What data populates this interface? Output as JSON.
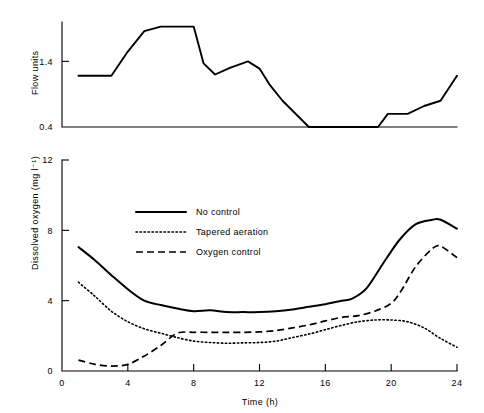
{
  "figure": {
    "background_color": "#ffffff",
    "ink_color": "#000000"
  },
  "chart_data": [
    {
      "id": "flow-chart",
      "type": "line",
      "title": "",
      "xlabel": "",
      "ylabel": "Flow units",
      "xlim": [
        0,
        24
      ],
      "ylim": [
        0.4,
        2.0
      ],
      "grid": false,
      "legend": "none",
      "yticks": [
        0.4,
        1.4
      ],
      "ytick_labels": [
        "0.4",
        "1.4"
      ],
      "xticks": [],
      "xtick_labels": [],
      "series": [
        {
          "name": "Flow",
          "style": "solid",
          "x": [
            1.0,
            3.0,
            4.0,
            5.0,
            6.0,
            7.0,
            8.0,
            8.6,
            9.3,
            10.2,
            11.3,
            12.0,
            12.6,
            13.4,
            15.0,
            19.2,
            19.8,
            21.0,
            22.0,
            23.0,
            24.0
          ],
          "y": [
            1.18,
            1.18,
            1.55,
            1.86,
            1.93,
            1.93,
            1.93,
            1.37,
            1.2,
            1.3,
            1.4,
            1.29,
            1.05,
            0.8,
            0.4,
            0.4,
            0.6,
            0.6,
            0.72,
            0.8,
            1.18
          ]
        }
      ]
    },
    {
      "id": "dissolved-oxygen-chart",
      "type": "line",
      "title": "",
      "xlabel": "Time (h)",
      "ylabel": "Dissolved oxygen (mg l⁻¹)",
      "xlim": [
        0,
        24
      ],
      "ylim": [
        0,
        12
      ],
      "grid": false,
      "legend": "inside-upper-left",
      "xticks": [
        0,
        4,
        8,
        12,
        16,
        20,
        24
      ],
      "xtick_labels": [
        "0",
        "4",
        "8",
        "12",
        "16",
        "20",
        "24"
      ],
      "yticks": [
        0,
        4,
        8,
        12
      ],
      "ytick_labels": [
        "0",
        "4",
        "8",
        "12"
      ],
      "series": [
        {
          "name": "No control",
          "style": "solid",
          "x": [
            1.0,
            2.0,
            3.0,
            4.0,
            5.0,
            6.0,
            7.0,
            8.0,
            9.0,
            10.0,
            11.0,
            12.0,
            13.0,
            14.0,
            15.0,
            16.0,
            17.0,
            17.6,
            18.5,
            19.5,
            20.5,
            21.5,
            22.5,
            23.0,
            24.0
          ],
          "y": [
            7.05,
            6.3,
            5.45,
            4.65,
            4.0,
            3.75,
            3.55,
            3.4,
            3.45,
            3.35,
            3.35,
            3.35,
            3.4,
            3.5,
            3.65,
            3.8,
            4.0,
            4.1,
            4.7,
            6.1,
            7.45,
            8.35,
            8.6,
            8.6,
            8.1
          ]
        },
        {
          "name": "Tapered aeration",
          "style": "dotted",
          "x": [
            1.0,
            2.0,
            3.0,
            4.0,
            5.0,
            6.0,
            7.0,
            8.0,
            9.0,
            10.0,
            11.0,
            12.0,
            13.0,
            14.0,
            15.0,
            16.0,
            17.0,
            18.0,
            19.0,
            20.0,
            21.0,
            22.0,
            23.0,
            24.0
          ],
          "y": [
            5.05,
            4.25,
            3.4,
            2.8,
            2.4,
            2.15,
            1.9,
            1.7,
            1.62,
            1.58,
            1.6,
            1.62,
            1.7,
            1.9,
            2.1,
            2.35,
            2.6,
            2.8,
            2.9,
            2.9,
            2.8,
            2.45,
            1.85,
            1.35
          ]
        },
        {
          "name": "Oxygen control",
          "style": "dashed",
          "x": [
            1.0,
            2.0,
            3.0,
            4.0,
            5.0,
            6.0,
            7.0,
            8.0,
            9.0,
            10.0,
            11.0,
            12.0,
            13.0,
            14.0,
            15.0,
            16.0,
            17.0,
            18.0,
            19.0,
            20.0,
            20.6,
            21.5,
            22.5,
            23.0,
            24.0
          ],
          "y": [
            0.62,
            0.38,
            0.28,
            0.38,
            0.85,
            1.45,
            2.15,
            2.2,
            2.2,
            2.2,
            2.2,
            2.22,
            2.3,
            2.45,
            2.62,
            2.85,
            3.05,
            3.15,
            3.4,
            3.85,
            4.55,
            5.95,
            6.95,
            7.1,
            6.45
          ]
        }
      ],
      "legend_entries": [
        {
          "label": "No control",
          "style": "solid"
        },
        {
          "label": "Tapered aeration",
          "style": "dotted"
        },
        {
          "label": "Oxygen control",
          "style": "dashed"
        }
      ]
    }
  ]
}
